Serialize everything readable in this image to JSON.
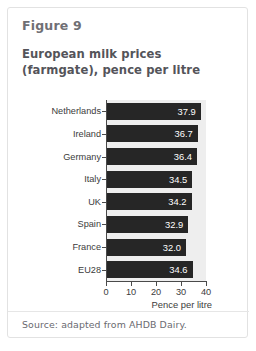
{
  "card": {
    "figure_label": "Figure 9",
    "title": "European milk prices (farmgate), pence per litre",
    "source": "Source: adapted from AHDB Dairy."
  },
  "chart_data": {
    "type": "bar",
    "orientation": "horizontal",
    "title": "European milk prices (farmgate), pence per litre",
    "categories": [
      "Netherlands",
      "Ireland",
      "Germany",
      "Italy",
      "UK",
      "Spain",
      "France",
      "EU28"
    ],
    "values": [
      37.9,
      36.7,
      36.4,
      34.5,
      34.2,
      32.9,
      32.0,
      34.6
    ],
    "value_labels": [
      "37.9",
      "36.7",
      "36.4",
      "34.5",
      "34.2",
      "32.9",
      "32.0",
      "34.6"
    ],
    "xlabel": "Pence per litre",
    "ylabel": "",
    "xlim": [
      0,
      40
    ],
    "xticks": [
      0,
      10,
      20,
      30,
      40
    ],
    "xtick_labels": [
      "0",
      "10",
      "20",
      "30",
      "40"
    ],
    "grid": false,
    "legend": false,
    "bar_color": "#262626",
    "plot_background": "#eeeeee",
    "value_label_color": "#ffffff"
  }
}
